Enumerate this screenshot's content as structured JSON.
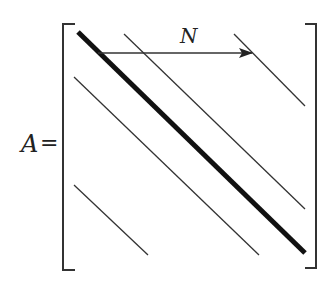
{
  "diagram": {
    "type": "banded-matrix",
    "matrix_label": "A",
    "equals_sign": "=",
    "arrow_label": "N",
    "colors": {
      "ink": "#222222",
      "background": "#ffffff"
    },
    "bands": [
      {
        "name": "main-diagonal",
        "weight": "thick"
      },
      {
        "name": "superdiagonal-near",
        "weight": "thin"
      },
      {
        "name": "superdiagonal-far",
        "weight": "thin"
      },
      {
        "name": "subdiagonal-near",
        "weight": "thin"
      },
      {
        "name": "subdiagonal-far",
        "weight": "thin"
      }
    ]
  }
}
